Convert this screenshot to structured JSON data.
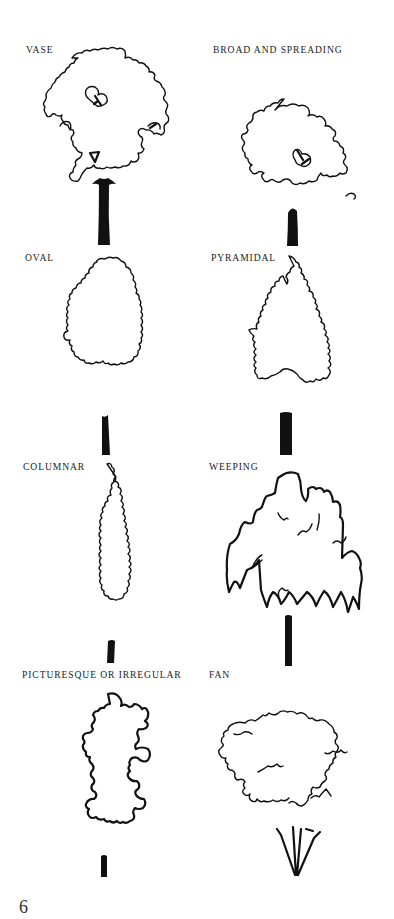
{
  "page": {
    "page_number": "6",
    "ink_color": "#111111",
    "background_color": "#ffffff"
  },
  "tree_forms": [
    {
      "label": "VASE",
      "column": "left",
      "row": 1
    },
    {
      "label": "BROAD AND SPREADING",
      "column": "right",
      "row": 1
    },
    {
      "label": "OVAL",
      "column": "left",
      "row": 2
    },
    {
      "label": "PYRAMIDAL",
      "column": "right",
      "row": 2
    },
    {
      "label": "COLUMNAR",
      "column": "left",
      "row": 3
    },
    {
      "label": "WEEPING",
      "column": "right",
      "row": 3
    },
    {
      "label": "PICTURESQUE OR IRREGULAR",
      "column": "left",
      "row": 4
    },
    {
      "label": "FAN",
      "column": "right",
      "row": 4
    }
  ]
}
